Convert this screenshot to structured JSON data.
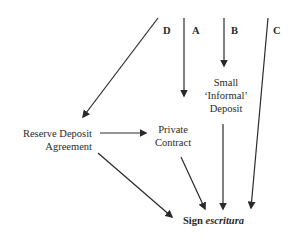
{
  "diagram": {
    "route_labels": {
      "d": "D",
      "a": "A",
      "b": "B",
      "c": "C"
    },
    "nodes": {
      "small_deposit": {
        "line1": "Small",
        "line2": "‘Informal’",
        "line3": "Deposit"
      },
      "reserve_deposit": {
        "line1": "Reserve Deposit",
        "line2": "Agreement"
      },
      "private_contract": {
        "line1": "Private",
        "line2": "Contract"
      },
      "sign": {
        "prefix": "Sign",
        "emphasis": "escritura"
      }
    },
    "edges": [
      {
        "from": "D",
        "to": "Reserve Deposit Agreement"
      },
      {
        "from": "A",
        "to": "Private Contract"
      },
      {
        "from": "B",
        "to": "Small 'Informal' Deposit"
      },
      {
        "from": "C",
        "to": "Sign escritura"
      },
      {
        "from": "Reserve Deposit Agreement",
        "to": "Private Contract"
      },
      {
        "from": "Reserve Deposit Agreement",
        "to": "Sign escritura"
      },
      {
        "from": "Private Contract",
        "to": "Sign escritura"
      },
      {
        "from": "Small 'Informal' Deposit",
        "to": "Sign escritura"
      }
    ],
    "colors": {
      "stroke": "#2a2a2a",
      "background": "#ffffff"
    }
  }
}
